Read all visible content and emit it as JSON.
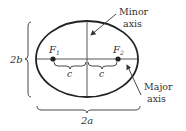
{
  "diagram": {
    "colors": {
      "stroke": "#222222",
      "text": "#333333",
      "background": "#ffffff"
    },
    "ellipse": {
      "cx": 87,
      "cy": 59,
      "rx": 51,
      "ry": 38
    },
    "foci": [
      {
        "id": "F1",
        "label_main": "F",
        "label_sub": "1",
        "x": 53,
        "y": 59
      },
      {
        "id": "F2",
        "label_main": "F",
        "label_sub": "2",
        "x": 118,
        "y": 59
      }
    ],
    "distance_labels": {
      "left_c": "c",
      "right_c": "c"
    },
    "dimension_labels": {
      "height": "2b",
      "width": "2a"
    },
    "callouts": {
      "minor_axis": {
        "line1": "Minor",
        "line2": "axis"
      },
      "major_axis": {
        "line1": "Major",
        "line2": "axis"
      }
    }
  }
}
